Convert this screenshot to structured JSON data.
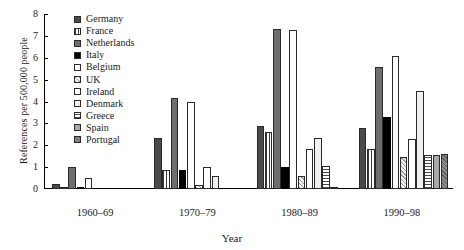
{
  "chart_data": {
    "type": "bar",
    "title": "",
    "xlabel": "Year",
    "ylabel": "References per 500,000 people",
    "ylim": [
      0,
      8
    ],
    "yticks": [
      "0",
      "1",
      "2",
      "3",
      "4",
      "5",
      "6",
      "7",
      "8"
    ],
    "grid": false,
    "legend_position": "top-center-inside",
    "categories": [
      "1960–69",
      "1970–79",
      "1980–89",
      "1990–98"
    ],
    "series": [
      {
        "name": "Germany",
        "swatch": "dark-gray-solid",
        "values": [
          0.22,
          2.35,
          2.9,
          2.8
        ]
      },
      {
        "name": "France",
        "swatch": "vertical-hatch",
        "values": [
          0.07,
          0.85,
          2.6,
          1.85
        ]
      },
      {
        "name": "Netherlands",
        "swatch": "medium-gray-solid",
        "values": [
          1.0,
          4.15,
          7.3,
          5.6
        ]
      },
      {
        "name": "Italy",
        "swatch": "black-solid",
        "values": [
          0.08,
          0.85,
          1.0,
          3.3
        ]
      },
      {
        "name": "Belgium",
        "swatch": "white-empty",
        "values": [
          0.5,
          4.0,
          7.25,
          6.1
        ]
      },
      {
        "name": "UK",
        "swatch": "cross-hatch-light",
        "values": [
          0.0,
          0.2,
          0.6,
          1.45
        ]
      },
      {
        "name": "Ireland",
        "swatch": "white-empty",
        "values": [
          0.0,
          1.0,
          1.85,
          2.3
        ]
      },
      {
        "name": "Denmark",
        "swatch": "white-empty",
        "values": [
          0.0,
          0.6,
          2.35,
          4.5
        ]
      },
      {
        "name": "Greece",
        "swatch": "horizontal-hatch",
        "values": [
          0.0,
          0.0,
          1.05,
          1.55
        ]
      },
      {
        "name": "Spain",
        "swatch": "light-gray-solid",
        "values": [
          0.0,
          0.0,
          0.06,
          1.55
        ]
      },
      {
        "name": "Portugal",
        "swatch": "gray-diagonal-texture",
        "values": [
          0.0,
          0.0,
          0.0,
          1.6
        ]
      }
    ]
  },
  "axis": {
    "ylabel": "References per 500,000 people",
    "xlabel": "Year"
  }
}
